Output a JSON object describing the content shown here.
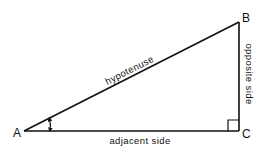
{
  "diagram": {
    "type": "right-triangle",
    "colors": {
      "stroke": "#111111",
      "background": "#ffffff"
    },
    "vertices": {
      "A": {
        "label": "A",
        "x": 24,
        "y": 131
      },
      "B": {
        "label": "B",
        "x": 239,
        "y": 22
      },
      "C": {
        "label": "C",
        "x": 239,
        "y": 131
      }
    },
    "sides": {
      "hypotenuse": {
        "label": "hypotenuse",
        "from": "A",
        "to": "B"
      },
      "adjacent": {
        "label": "adjacent side",
        "from": "A",
        "to": "C"
      },
      "opposite": {
        "label": "opposite side",
        "from": "C",
        "to": "B"
      }
    },
    "markers": {
      "angle_at": "A",
      "right_angle_at": "C"
    }
  }
}
